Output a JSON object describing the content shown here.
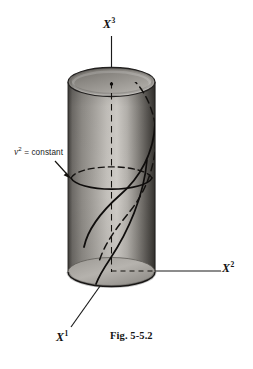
{
  "figure": {
    "caption": "Fig. 5-5.2",
    "background_color": "#ffffff",
    "ink_color": "#1a1a1a",
    "surface_light": "#c9c7c4",
    "surface_dark": "#4a4845",
    "axes": [
      {
        "id": "x3",
        "label_text": "X",
        "label_sup": "3",
        "description": "vertical-axis-upward"
      },
      {
        "id": "x2",
        "label_text": "X",
        "label_sup": "2",
        "description": "horizontal-axis-right"
      },
      {
        "id": "x1",
        "label_text": "X",
        "label_sup": "1",
        "description": "oblique-axis-lower-left"
      }
    ],
    "annotations": [
      {
        "id": "v-squared-constant",
        "symbol": "v",
        "superscript": "2",
        "relation": "= constant",
        "full_text": "v² = constant",
        "pointer": "arrow-down-right"
      }
    ],
    "objects": [
      {
        "id": "cylinder",
        "name": "shaded-cylinder-surface"
      },
      {
        "id": "coordinate-circle",
        "name": "v2-constant-circle"
      },
      {
        "id": "helix-curve",
        "name": "coordinate-curve-on-cylinder"
      },
      {
        "id": "origin-dot",
        "name": "axis-top-point"
      }
    ]
  }
}
